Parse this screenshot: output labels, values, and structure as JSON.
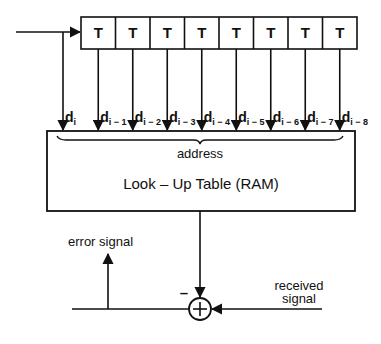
{
  "diagram": {
    "delay_line": {
      "cell_label": "T",
      "cell_count": 8,
      "cells": [
        "T",
        "T",
        "T",
        "T",
        "T",
        "T",
        "T",
        "T"
      ]
    },
    "taps": [
      {
        "base": "d",
        "sub": "i"
      },
      {
        "base": "d",
        "sub": "i − 1"
      },
      {
        "base": "d",
        "sub": "i − 2"
      },
      {
        "base": "d",
        "sub": "i − 3"
      },
      {
        "base": "d",
        "sub": "i − 4"
      },
      {
        "base": "d",
        "sub": "i − 5"
      },
      {
        "base": "d",
        "sub": "i − 6"
      },
      {
        "base": "d",
        "sub": "i − 7"
      },
      {
        "base": "d",
        "sub": "i − 8"
      }
    ],
    "lut": {
      "address_label": "address",
      "title": "Look – Up  Table  (RAM)"
    },
    "summer": {
      "symbol": "+",
      "minus_sign": "–"
    },
    "error_signal_label": "error  signal",
    "received_signal_label": [
      "received",
      "signal"
    ],
    "colors": {
      "ink": "#111111",
      "background": "#ffffff"
    }
  }
}
